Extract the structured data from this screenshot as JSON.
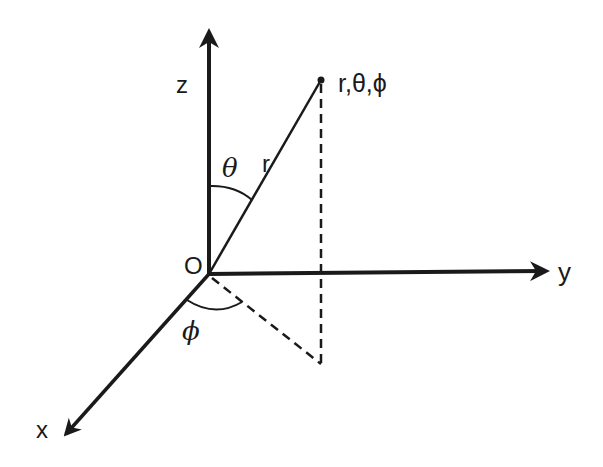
{
  "diagram": {
    "colors": {
      "stroke": "#1a1a1a",
      "background": "#ffffff"
    },
    "origin": {
      "label": "O",
      "x": 209,
      "y": 274
    },
    "axes": [
      {
        "name": "z",
        "label": "z",
        "from": [
          209,
          274
        ],
        "to": [
          209,
          28
        ]
      },
      {
        "name": "y",
        "label": "y",
        "from": [
          209,
          274
        ],
        "to": [
          550,
          271
        ]
      },
      {
        "name": "x",
        "label": "x",
        "from": [
          209,
          274
        ],
        "to": [
          63,
          437
        ]
      }
    ],
    "point": {
      "label": "r,θ,ϕ",
      "x": 321,
      "y": 80
    },
    "radius_label": "r",
    "theta_label": "θ",
    "phi_label": "ϕ",
    "projection_foot": {
      "x": 321,
      "y": 364
    }
  }
}
